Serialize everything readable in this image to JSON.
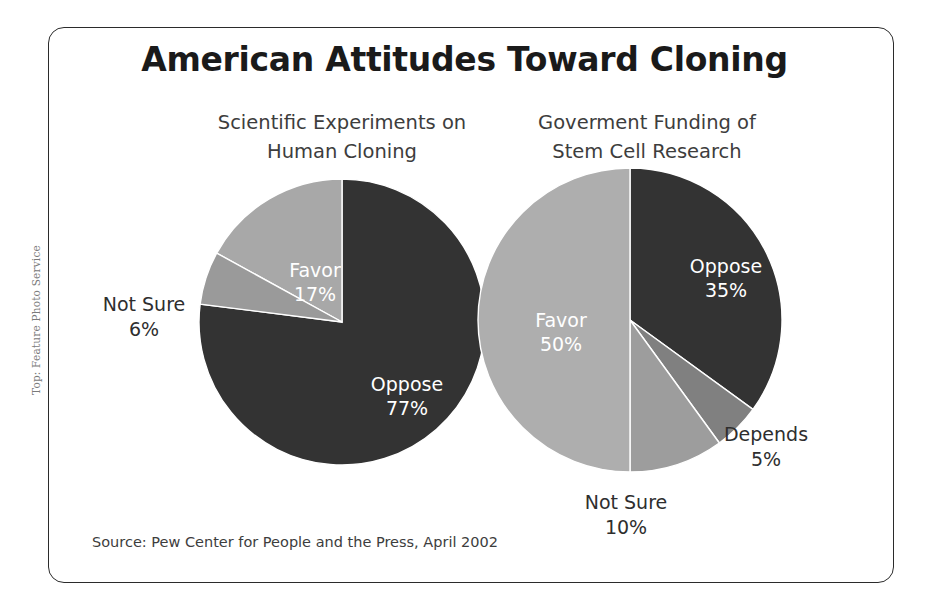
{
  "figure": {
    "title": "American Attitudes Toward Cloning",
    "source": "Source: Pew Center for People and the Press, April 2002",
    "credit": "Top: Feature Photo Service"
  },
  "chart_data": [
    {
      "type": "pie",
      "title": "Scientific Experiments on Human Cloning",
      "title_line1": "Scientific Experiments on",
      "title_line2": "Human Cloning",
      "categories": [
        "Oppose",
        "Favor",
        "Not Sure"
      ],
      "values": [
        77,
        17,
        6
      ],
      "labels": [
        "Oppose 77%",
        "Favor 17%",
        "Not Sure 6%"
      ],
      "slices": [
        {
          "name": "Oppose",
          "value": 77,
          "label": "Oppose",
          "value_text": "77%",
          "color": "#333333",
          "label_position": "inside"
        },
        {
          "name": "Favor",
          "value": 17,
          "label": "Favor",
          "value_text": "17%",
          "color": "#a8a8a8",
          "label_position": "inside"
        },
        {
          "name": "Not Sure",
          "value": 6,
          "label": "Not Sure",
          "value_text": "6%",
          "color": "#9a9a9a",
          "label_position": "outside"
        }
      ],
      "start_angle_deg": 0,
      "direction": "counterclockwise",
      "legend": "none"
    },
    {
      "type": "pie",
      "title": "Goverment Funding of Stem Cell Research",
      "title_line1": "Goverment Funding of",
      "title_line2": "Stem Cell Research",
      "categories": [
        "Favor",
        "Oppose",
        "Not Sure",
        "Depends"
      ],
      "values": [
        50,
        35,
        10,
        5
      ],
      "labels": [
        "Favor 50%",
        "Oppose 35%",
        "Not Sure 10%",
        "Depends 5%"
      ],
      "slices": [
        {
          "name": "Oppose",
          "value": 35,
          "label": "Oppose",
          "value_text": "35%",
          "color": "#333333",
          "label_position": "inside"
        },
        {
          "name": "Depends",
          "value": 5,
          "label": "Depends",
          "value_text": "5%",
          "color": "#808080",
          "label_position": "outside"
        },
        {
          "name": "Not Sure",
          "value": 10,
          "label": "Not Sure",
          "value_text": "10%",
          "color": "#9d9d9d",
          "label_position": "outside"
        },
        {
          "name": "Favor",
          "value": 50,
          "label": "Favor",
          "value_text": "50%",
          "color": "#aeaeae",
          "label_position": "inside"
        }
      ],
      "start_angle_deg": 0,
      "direction": "clockwise",
      "legend": "none"
    }
  ]
}
